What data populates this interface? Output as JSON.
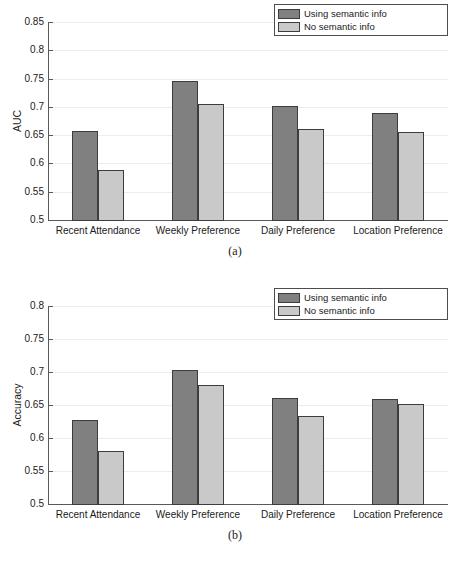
{
  "figure": {
    "width": 470,
    "height": 568,
    "background": "#ffffff"
  },
  "style": {
    "series_colors": [
      "#808080",
      "#c9c9c9"
    ],
    "bar_edge_color": "#3d3d3d",
    "axis_color": "#595959",
    "grid_color": "#ededed",
    "text_color": "#1a1a1a"
  },
  "panels": [
    {
      "id": "a",
      "caption": "(a)",
      "chart_data": {
        "type": "bar",
        "title": "",
        "xlabel": "",
        "ylabel": "AUC",
        "ylim": [
          0.5,
          0.85
        ],
        "yticks": [
          0.5,
          0.55,
          0.6,
          0.65,
          0.7,
          0.75,
          0.8,
          0.85
        ],
        "ytick_labels": [
          "0.5",
          "0.55",
          "0.6",
          "0.65",
          "0.7",
          "0.75",
          "0.8",
          "0.85"
        ],
        "grid": true,
        "legend_position": "top-right",
        "categories": [
          "Recent Attendance",
          "Weekly Preference",
          "Daily Preference",
          "Location Preference"
        ],
        "series": [
          {
            "name": "Using semantic info",
            "color": "#808080",
            "values": [
              0.658,
              0.746,
              0.701,
              0.689
            ]
          },
          {
            "name": "No semantic info",
            "color": "#c9c9c9",
            "values": [
              0.588,
              0.705,
              0.66,
              0.656
            ]
          }
        ]
      }
    },
    {
      "id": "b",
      "caption": "(b)",
      "chart_data": {
        "type": "bar",
        "title": "",
        "xlabel": "",
        "ylabel": "Accuracy",
        "ylim": [
          0.5,
          0.8
        ],
        "yticks": [
          0.5,
          0.55,
          0.6,
          0.65,
          0.7,
          0.75,
          0.8
        ],
        "ytick_labels": [
          "0.5",
          "0.55",
          "0.6",
          "0.65",
          "0.7",
          "0.75",
          "0.8"
        ],
        "grid": true,
        "legend_position": "top-right",
        "categories": [
          "Recent Attendance",
          "Weekly Preference",
          "Daily Preference",
          "Location Preference"
        ],
        "series": [
          {
            "name": "Using semantic info",
            "color": "#808080",
            "values": [
              0.628,
              0.703,
              0.661,
              0.659
            ]
          },
          {
            "name": "No semantic info",
            "color": "#c9c9c9",
            "values": [
              0.581,
              0.68,
              0.633,
              0.651
            ]
          }
        ]
      }
    }
  ]
}
